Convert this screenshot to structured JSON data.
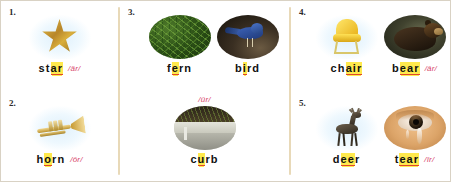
{
  "worksheet": {
    "title": "R-Controlled Vowel Picture Word List",
    "accent_highlight": "#ffe94d",
    "accent_underline": "#e0472c",
    "phonetic_color": "#d8456b",
    "divider_color": "#e8d9b8"
  },
  "items": [
    {
      "number": "1.",
      "words": [
        {
          "picture": "star-picture",
          "pre_label": "",
          "segments": [
            {
              "text": "st",
              "highlight": false
            },
            {
              "text": "ar",
              "highlight": true
            }
          ],
          "full_word": "star",
          "phonetic": "/är/"
        }
      ]
    },
    {
      "number": "2.",
      "words": [
        {
          "picture": "trumpet-picture",
          "pre_label": "",
          "segments": [
            {
              "text": "h",
              "highlight": false
            },
            {
              "text": "o",
              "highlight": true
            },
            {
              "text": "rn",
              "highlight": false
            }
          ],
          "full_word": "horn",
          "phonetic": "/ôr/"
        }
      ]
    },
    {
      "number": "3.",
      "words": [
        {
          "picture": "fern-picture",
          "pre_label": "",
          "segments": [
            {
              "text": "f",
              "highlight": false
            },
            {
              "text": "e",
              "highlight": true
            },
            {
              "text": "rn",
              "highlight": false
            }
          ],
          "full_word": "fern",
          "phonetic": ""
        },
        {
          "picture": "bird-picture",
          "pre_label": "",
          "segments": [
            {
              "text": "b",
              "highlight": false
            },
            {
              "text": "i",
              "highlight": true
            },
            {
              "text": "rd",
              "highlight": false
            }
          ],
          "full_word": "bird",
          "phonetic": ""
        },
        {
          "picture": "curb-picture",
          "pre_label": "/ûr/",
          "segments": [
            {
              "text": "c",
              "highlight": false
            },
            {
              "text": "u",
              "highlight": true
            },
            {
              "text": "rb",
              "highlight": false
            }
          ],
          "full_word": "curb",
          "phonetic": ""
        }
      ]
    },
    {
      "number": "4.",
      "words": [
        {
          "picture": "chair-picture",
          "pre_label": "",
          "segments": [
            {
              "text": "ch",
              "highlight": false
            },
            {
              "text": "air",
              "highlight": true
            }
          ],
          "full_word": "chair",
          "phonetic": ""
        },
        {
          "picture": "bear-picture",
          "pre_label": "",
          "segments": [
            {
              "text": "b",
              "highlight": false
            },
            {
              "text": "ear",
              "highlight": true
            }
          ],
          "full_word": "bear",
          "phonetic": "/âr/"
        }
      ]
    },
    {
      "number": "5.",
      "words": [
        {
          "picture": "deer-picture",
          "pre_label": "",
          "segments": [
            {
              "text": "d",
              "highlight": false
            },
            {
              "text": "ee",
              "highlight": true
            },
            {
              "text": "r",
              "highlight": false
            }
          ],
          "full_word": "deer",
          "phonetic": ""
        },
        {
          "picture": "tear-picture",
          "pre_label": "",
          "segments": [
            {
              "text": "t",
              "highlight": false
            },
            {
              "text": "ear",
              "highlight": true
            }
          ],
          "full_word": "tear",
          "phonetic": "/îr/"
        }
      ]
    }
  ]
}
